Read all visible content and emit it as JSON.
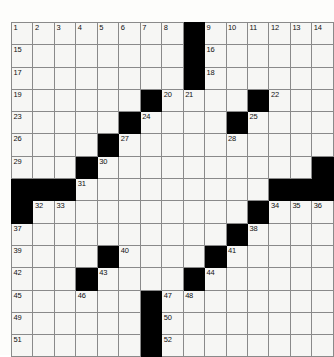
{
  "puzzle": {
    "title": "Crossword Grid",
    "columns": 15,
    "rows": 15,
    "colors": {
      "block": "#000000",
      "cell": "#f6f6f4",
      "grid_line": "#8a8a8a",
      "border": "#6a6a6a",
      "number_text": "#111111",
      "page_background": "#fdfdfb"
    },
    "cells": [
      [
        {
          "block": false,
          "num": "1"
        },
        {
          "block": false,
          "num": "2"
        },
        {
          "block": false,
          "num": "3"
        },
        {
          "block": false,
          "num": "4"
        },
        {
          "block": false,
          "num": "5"
        },
        {
          "block": false,
          "num": "6"
        },
        {
          "block": false,
          "num": "7"
        },
        {
          "block": false,
          "num": "8"
        },
        {
          "block": true,
          "num": ""
        },
        {
          "block": false,
          "num": "9"
        },
        {
          "block": false,
          "num": "10"
        },
        {
          "block": false,
          "num": "11"
        },
        {
          "block": false,
          "num": "12"
        },
        {
          "block": false,
          "num": "13"
        },
        {
          "block": false,
          "num": "14"
        }
      ],
      [
        {
          "block": false,
          "num": "15"
        },
        {
          "block": false,
          "num": ""
        },
        {
          "block": false,
          "num": ""
        },
        {
          "block": false,
          "num": ""
        },
        {
          "block": false,
          "num": ""
        },
        {
          "block": false,
          "num": ""
        },
        {
          "block": false,
          "num": ""
        },
        {
          "block": false,
          "num": ""
        },
        {
          "block": true,
          "num": ""
        },
        {
          "block": false,
          "num": "16"
        },
        {
          "block": false,
          "num": ""
        },
        {
          "block": false,
          "num": ""
        },
        {
          "block": false,
          "num": ""
        },
        {
          "block": false,
          "num": ""
        },
        {
          "block": false,
          "num": ""
        }
      ],
      [
        {
          "block": false,
          "num": "17"
        },
        {
          "block": false,
          "num": ""
        },
        {
          "block": false,
          "num": ""
        },
        {
          "block": false,
          "num": ""
        },
        {
          "block": false,
          "num": ""
        },
        {
          "block": false,
          "num": ""
        },
        {
          "block": false,
          "num": ""
        },
        {
          "block": false,
          "num": ""
        },
        {
          "block": true,
          "num": ""
        },
        {
          "block": false,
          "num": "18"
        },
        {
          "block": false,
          "num": ""
        },
        {
          "block": false,
          "num": ""
        },
        {
          "block": false,
          "num": ""
        },
        {
          "block": false,
          "num": ""
        },
        {
          "block": false,
          "num": ""
        }
      ],
      [
        {
          "block": false,
          "num": "19"
        },
        {
          "block": false,
          "num": ""
        },
        {
          "block": false,
          "num": ""
        },
        {
          "block": false,
          "num": ""
        },
        {
          "block": false,
          "num": ""
        },
        {
          "block": false,
          "num": ""
        },
        {
          "block": true,
          "num": ""
        },
        {
          "block": false,
          "num": "20"
        },
        {
          "block": false,
          "num": "21"
        },
        {
          "block": false,
          "num": ""
        },
        {
          "block": false,
          "num": ""
        },
        {
          "block": true,
          "num": ""
        },
        {
          "block": false,
          "num": "22"
        },
        {
          "block": false,
          "num": ""
        },
        {
          "block": false,
          "num": ""
        }
      ],
      [
        {
          "block": false,
          "num": "23"
        },
        {
          "block": false,
          "num": ""
        },
        {
          "block": false,
          "num": ""
        },
        {
          "block": false,
          "num": ""
        },
        {
          "block": false,
          "num": ""
        },
        {
          "block": true,
          "num": ""
        },
        {
          "block": false,
          "num": "24"
        },
        {
          "block": false,
          "num": ""
        },
        {
          "block": false,
          "num": ""
        },
        {
          "block": false,
          "num": ""
        },
        {
          "block": true,
          "num": ""
        },
        {
          "block": false,
          "num": "25"
        },
        {
          "block": false,
          "num": ""
        },
        {
          "block": false,
          "num": ""
        },
        {
          "block": false,
          "num": ""
        }
      ],
      [
        {
          "block": false,
          "num": "26"
        },
        {
          "block": false,
          "num": ""
        },
        {
          "block": false,
          "num": ""
        },
        {
          "block": false,
          "num": ""
        },
        {
          "block": true,
          "num": ""
        },
        {
          "block": false,
          "num": "27"
        },
        {
          "block": false,
          "num": ""
        },
        {
          "block": false,
          "num": ""
        },
        {
          "block": false,
          "num": ""
        },
        {
          "block": false,
          "num": ""
        },
        {
          "block": false,
          "num": "28"
        },
        {
          "block": false,
          "num": ""
        },
        {
          "block": false,
          "num": ""
        },
        {
          "block": false,
          "num": ""
        },
        {
          "block": false,
          "num": ""
        }
      ],
      [
        {
          "block": false,
          "num": "29"
        },
        {
          "block": false,
          "num": ""
        },
        {
          "block": false,
          "num": ""
        },
        {
          "block": true,
          "num": ""
        },
        {
          "block": false,
          "num": "30"
        },
        {
          "block": false,
          "num": ""
        },
        {
          "block": false,
          "num": ""
        },
        {
          "block": false,
          "num": ""
        },
        {
          "block": false,
          "num": ""
        },
        {
          "block": false,
          "num": ""
        },
        {
          "block": false,
          "num": ""
        },
        {
          "block": false,
          "num": ""
        },
        {
          "block": false,
          "num": ""
        },
        {
          "block": false,
          "num": ""
        },
        {
          "block": true,
          "num": ""
        }
      ],
      [
        {
          "block": true,
          "num": ""
        },
        {
          "block": true,
          "num": ""
        },
        {
          "block": true,
          "num": ""
        },
        {
          "block": false,
          "num": "31"
        },
        {
          "block": false,
          "num": ""
        },
        {
          "block": false,
          "num": ""
        },
        {
          "block": false,
          "num": ""
        },
        {
          "block": false,
          "num": ""
        },
        {
          "block": false,
          "num": ""
        },
        {
          "block": false,
          "num": ""
        },
        {
          "block": false,
          "num": ""
        },
        {
          "block": false,
          "num": ""
        },
        {
          "block": true,
          "num": ""
        },
        {
          "block": true,
          "num": ""
        },
        {
          "block": true,
          "num": ""
        }
      ],
      [
        {
          "block": true,
          "num": ""
        },
        {
          "block": false,
          "num": "32"
        },
        {
          "block": false,
          "num": "33"
        },
        {
          "block": false,
          "num": ""
        },
        {
          "block": false,
          "num": ""
        },
        {
          "block": false,
          "num": ""
        },
        {
          "block": false,
          "num": ""
        },
        {
          "block": false,
          "num": ""
        },
        {
          "block": false,
          "num": ""
        },
        {
          "block": false,
          "num": ""
        },
        {
          "block": false,
          "num": ""
        },
        {
          "block": true,
          "num": ""
        },
        {
          "block": false,
          "num": "34"
        },
        {
          "block": false,
          "num": "35"
        },
        {
          "block": false,
          "num": "36"
        }
      ],
      [
        {
          "block": false,
          "num": "37"
        },
        {
          "block": false,
          "num": ""
        },
        {
          "block": false,
          "num": ""
        },
        {
          "block": false,
          "num": ""
        },
        {
          "block": false,
          "num": ""
        },
        {
          "block": false,
          "num": ""
        },
        {
          "block": false,
          "num": ""
        },
        {
          "block": false,
          "num": ""
        },
        {
          "block": false,
          "num": ""
        },
        {
          "block": false,
          "num": ""
        },
        {
          "block": true,
          "num": ""
        },
        {
          "block": false,
          "num": "38"
        },
        {
          "block": false,
          "num": ""
        },
        {
          "block": false,
          "num": ""
        },
        {
          "block": false,
          "num": ""
        }
      ],
      [
        {
          "block": false,
          "num": "39"
        },
        {
          "block": false,
          "num": ""
        },
        {
          "block": false,
          "num": ""
        },
        {
          "block": false,
          "num": ""
        },
        {
          "block": true,
          "num": ""
        },
        {
          "block": false,
          "num": "40"
        },
        {
          "block": false,
          "num": ""
        },
        {
          "block": false,
          "num": ""
        },
        {
          "block": false,
          "num": ""
        },
        {
          "block": true,
          "num": ""
        },
        {
          "block": false,
          "num": "41"
        },
        {
          "block": false,
          "num": ""
        },
        {
          "block": false,
          "num": ""
        },
        {
          "block": false,
          "num": ""
        },
        {
          "block": false,
          "num": ""
        }
      ],
      [
        {
          "block": false,
          "num": "42"
        },
        {
          "block": false,
          "num": ""
        },
        {
          "block": false,
          "num": ""
        },
        {
          "block": true,
          "num": ""
        },
        {
          "block": false,
          "num": "43"
        },
        {
          "block": false,
          "num": ""
        },
        {
          "block": false,
          "num": ""
        },
        {
          "block": false,
          "num": ""
        },
        {
          "block": true,
          "num": ""
        },
        {
          "block": false,
          "num": "44"
        },
        {
          "block": false,
          "num": ""
        },
        {
          "block": false,
          "num": ""
        },
        {
          "block": false,
          "num": ""
        },
        {
          "block": false,
          "num": ""
        },
        {
          "block": false,
          "num": ""
        }
      ],
      [
        {
          "block": false,
          "num": "45"
        },
        {
          "block": false,
          "num": ""
        },
        {
          "block": false,
          "num": ""
        },
        {
          "block": false,
          "num": "46"
        },
        {
          "block": false,
          "num": ""
        },
        {
          "block": false,
          "num": ""
        },
        {
          "block": true,
          "num": ""
        },
        {
          "block": false,
          "num": "47"
        },
        {
          "block": false,
          "num": "48"
        },
        {
          "block": false,
          "num": ""
        },
        {
          "block": false,
          "num": ""
        },
        {
          "block": false,
          "num": ""
        },
        {
          "block": false,
          "num": ""
        },
        {
          "block": false,
          "num": ""
        },
        {
          "block": false,
          "num": ""
        }
      ],
      [
        {
          "block": false,
          "num": "49"
        },
        {
          "block": false,
          "num": ""
        },
        {
          "block": false,
          "num": ""
        },
        {
          "block": false,
          "num": ""
        },
        {
          "block": false,
          "num": ""
        },
        {
          "block": false,
          "num": ""
        },
        {
          "block": true,
          "num": ""
        },
        {
          "block": false,
          "num": "50"
        },
        {
          "block": false,
          "num": ""
        },
        {
          "block": false,
          "num": ""
        },
        {
          "block": false,
          "num": ""
        },
        {
          "block": false,
          "num": ""
        },
        {
          "block": false,
          "num": ""
        },
        {
          "block": false,
          "num": ""
        },
        {
          "block": false,
          "num": ""
        }
      ],
      [
        {
          "block": false,
          "num": "51"
        },
        {
          "block": false,
          "num": ""
        },
        {
          "block": false,
          "num": ""
        },
        {
          "block": false,
          "num": ""
        },
        {
          "block": false,
          "num": ""
        },
        {
          "block": false,
          "num": ""
        },
        {
          "block": true,
          "num": ""
        },
        {
          "block": false,
          "num": "52"
        },
        {
          "block": false,
          "num": ""
        },
        {
          "block": false,
          "num": ""
        },
        {
          "block": false,
          "num": ""
        },
        {
          "block": false,
          "num": ""
        },
        {
          "block": false,
          "num": ""
        },
        {
          "block": false,
          "num": ""
        },
        {
          "block": false,
          "num": ""
        }
      ]
    ]
  }
}
